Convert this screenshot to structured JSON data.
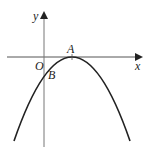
{
  "figure": {
    "type": "parabola-on-axes",
    "axes": {
      "x_label": "x",
      "y_label": "y",
      "origin_label": "O"
    },
    "points": [
      {
        "label": "A",
        "description": "vertex of parabola on the x-axis"
      },
      {
        "label": "B",
        "description": "intersection of parabola with negative y-axis"
      }
    ],
    "curve": {
      "description": "downward-opening parabola tangent to x-axis at A",
      "color": "#222222"
    },
    "axis_color": "#444444"
  }
}
